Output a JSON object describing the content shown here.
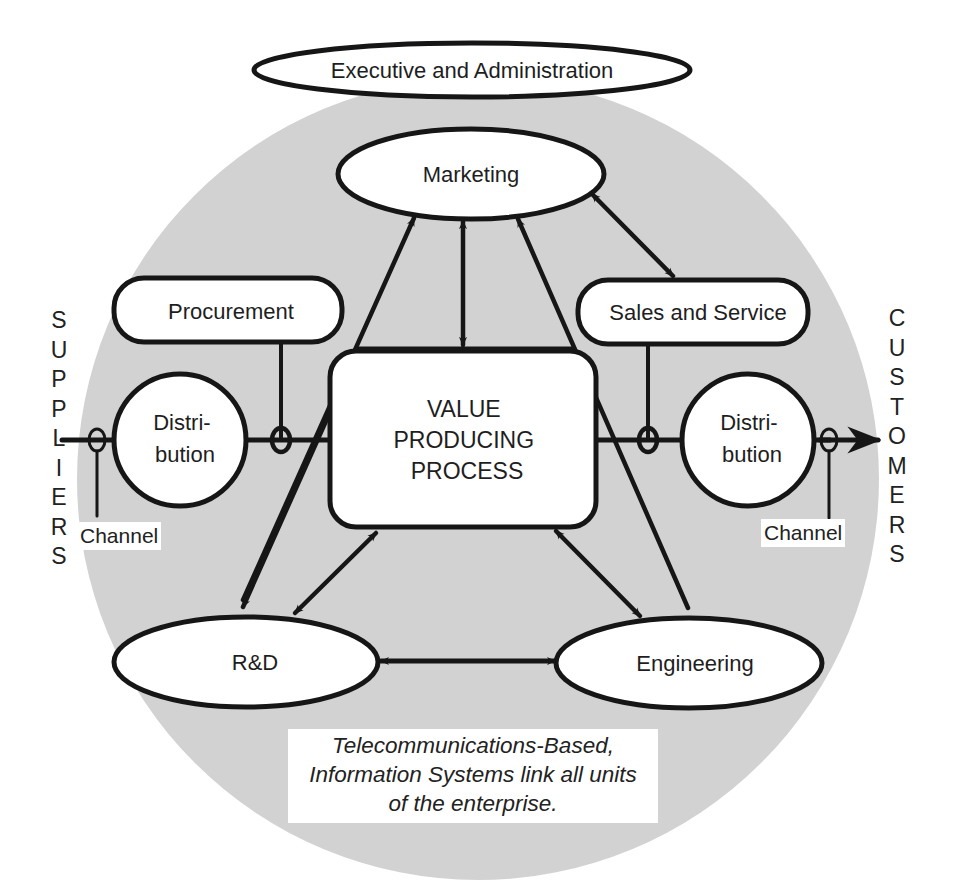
{
  "diagram": {
    "top_label": "Executive and Administration",
    "nodes": {
      "marketing": "Marketing",
      "procurement": "Procurement",
      "sales": "Sales and Service",
      "value_process": [
        "VALUE",
        "PRODUCING",
        "PROCESS"
      ],
      "distribution_left": [
        "Distri-",
        "bution"
      ],
      "distribution_right": [
        "Distri-",
        "bution"
      ],
      "rnd": "R&D",
      "engineering": "Engineering"
    },
    "channel_left": "Channel",
    "channel_right": "Channel",
    "side_left": [
      "S",
      "U",
      "P",
      "P",
      "L",
      "I",
      "E",
      "R",
      "S"
    ],
    "side_right": [
      "C",
      "U",
      "S",
      "T",
      "O",
      "M",
      "E",
      "R",
      "S"
    ],
    "caption": [
      "Telecommunications-Based,",
      "Information Systems link all units",
      "of the enterprise."
    ],
    "colors": {
      "background_circle": "#d2d2d2",
      "node_fill": "#ffffff",
      "line": "#161616"
    },
    "links": [
      {
        "from": "Value Producing Process",
        "to": "Marketing",
        "type": "bidirectional"
      },
      {
        "from": "R&D",
        "to": "Marketing",
        "type": "directed-to-marketing"
      },
      {
        "from": "Engineering",
        "to": "Marketing",
        "type": "directed-to-marketing"
      },
      {
        "from": "Marketing",
        "to": "Sales and Service",
        "type": "bidirectional"
      },
      {
        "from": "Value Producing Process",
        "to": "R&D",
        "type": "bidirectional"
      },
      {
        "from": "Value Producing Process",
        "to": "Engineering",
        "type": "bidirectional"
      },
      {
        "from": "R&D",
        "to": "Engineering",
        "type": "bidirectional"
      },
      {
        "from": "Suppliers",
        "to": "Distribution (left)",
        "type": "channel"
      },
      {
        "from": "Distribution (right)",
        "to": "Customers",
        "type": "channel-arrow"
      }
    ]
  }
}
